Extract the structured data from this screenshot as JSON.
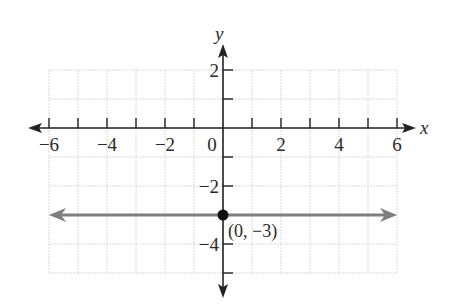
{
  "chart_data": {
    "type": "line",
    "title": "",
    "xlabel": "x",
    "ylabel": "y",
    "xlim": [
      -6,
      6
    ],
    "ylim": [
      -5,
      2
    ],
    "grid": true,
    "x_tick_labels": [
      "−6",
      "−4",
      "−2",
      "0",
      "2",
      "4",
      "6"
    ],
    "x_tick_values": [
      -6,
      -4,
      -2,
      0,
      2,
      4,
      6
    ],
    "y_tick_labels": [
      "2",
      "−2",
      "−4"
    ],
    "y_tick_values": [
      2,
      -2,
      -4
    ],
    "series": [
      {
        "name": "y = -3",
        "kind": "horizontal line with arrows",
        "x": [
          -6,
          6
        ],
        "y": [
          -3,
          -3
        ],
        "color": "#7f7f7f"
      }
    ],
    "points": [
      {
        "x": 0,
        "y": -3,
        "label": "(0, −3)",
        "color": "#111111"
      }
    ]
  },
  "colors": {
    "axis": "#222222",
    "grid": "#d9d9d9",
    "line": "#7f7f7f",
    "point": "#111111"
  }
}
